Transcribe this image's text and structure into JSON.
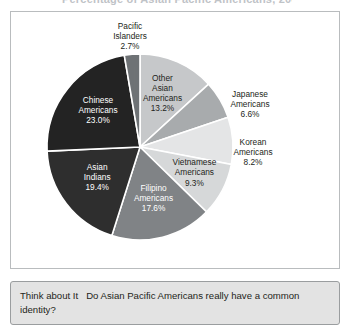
{
  "figure": {
    "title": "Percentage of Asian Pacific Americans, 2000",
    "caption_lead": "Think about It",
    "caption_text": "Do Asian Pacific Americans really have a common identity?"
  },
  "chart_data": {
    "type": "pie",
    "title": "Percentage of Asian Pacific Americans, 2000",
    "xlabel": "",
    "ylabel": "",
    "units": "percent",
    "start_angle_deg": 0,
    "direction": "clockwise",
    "legend": "none",
    "labels_inside": true,
    "categories": [
      "Other Asian Americans",
      "Japanese Americans",
      "Korean Americans",
      "Vietnamese Americans",
      "Filipino Americans",
      "Asian Indians",
      "Chinese Americans",
      "Pacific Islanders"
    ],
    "values": [
      13.2,
      6.6,
      8.2,
      9.3,
      17.6,
      19.4,
      23.0,
      2.7
    ],
    "colors": [
      "#c6c8ca",
      "#a8abad",
      "#e4e5e6",
      "#d6d8d9",
      "#808386",
      "#2e2e2e",
      "#232323",
      "#6e7275"
    ],
    "slices": [
      {
        "name": "Other Asian Americans",
        "value": 13.2,
        "label_lines": [
          "Other",
          "Asian",
          "Americans",
          "13.2%"
        ],
        "percent_text": "13.2%",
        "color": "#c6c8ca",
        "text_tone": "on-light",
        "placement": "inside"
      },
      {
        "name": "Japanese Americans",
        "value": 6.6,
        "label_lines": [
          "Japanese",
          "Americans",
          "6.6%"
        ],
        "percent_text": "6.6%",
        "color": "#a8abad",
        "text_tone": "on-light",
        "placement": "callout"
      },
      {
        "name": "Korean Americans",
        "value": 8.2,
        "label_lines": [
          "Korean",
          "Americans",
          "8.2%"
        ],
        "percent_text": "8.2%",
        "color": "#e4e5e6",
        "text_tone": "on-light",
        "placement": "callout"
      },
      {
        "name": "Vietnamese Americans",
        "value": 9.3,
        "label_lines": [
          "Vietnamese",
          "Americans",
          "9.3%"
        ],
        "percent_text": "9.3%",
        "color": "#d6d8d9",
        "text_tone": "on-light",
        "placement": "inside"
      },
      {
        "name": "Filipino Americans",
        "value": 17.6,
        "label_lines": [
          "Filipino",
          "Americans",
          "17.6%"
        ],
        "percent_text": "17.6%",
        "color": "#808386",
        "text_tone": "on-dark",
        "placement": "inside"
      },
      {
        "name": "Asian Indians",
        "value": 19.4,
        "label_lines": [
          "Asian",
          "Indians",
          "19.4%"
        ],
        "percent_text": "19.4%",
        "color": "#2e2e2e",
        "text_tone": "on-dark",
        "placement": "inside"
      },
      {
        "name": "Chinese Americans",
        "value": 23.0,
        "label_lines": [
          "Chinese",
          "Americans",
          "23.0%"
        ],
        "percent_text": "23.0%",
        "color": "#232323",
        "text_tone": "on-dark",
        "placement": "inside"
      },
      {
        "name": "Pacific Islanders",
        "value": 2.7,
        "label_lines": [
          "Pacific",
          "Islanders",
          "2.7%"
        ],
        "percent_text": "2.7%",
        "color": "#6e7275",
        "text_tone": "on-light",
        "placement": "callout"
      }
    ]
  }
}
